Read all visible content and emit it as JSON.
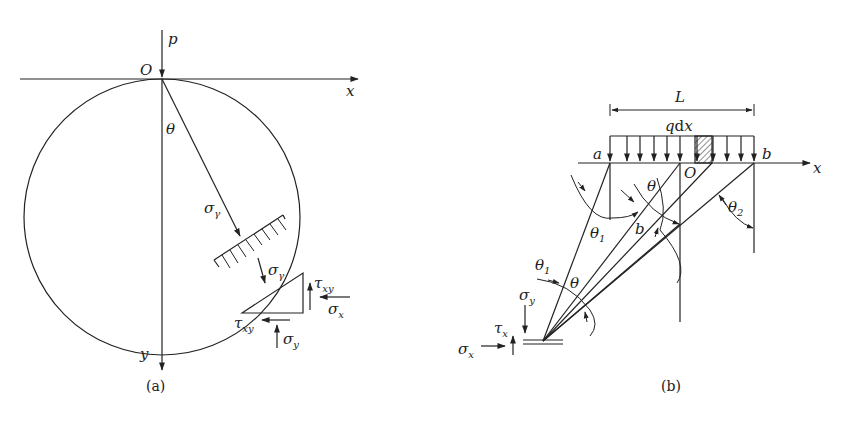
{
  "figure_a": {
    "caption": "(a)",
    "origin_label": "O",
    "load_label": "p",
    "x_axis_label": "x",
    "y_axis_label": "y",
    "angle_label": "θ",
    "radial_stress": {
      "base": "σ",
      "sub": "γ"
    },
    "element_stresses": {
      "sigma_r": {
        "base": "σ",
        "sub": "γ"
      },
      "tau_xy_right": {
        "base": "τ",
        "sub": "xy"
      },
      "sigma_x": {
        "base": "σ",
        "sub": "x"
      },
      "tau_xy_bottom": {
        "base": "τ",
        "sub": "xy"
      },
      "sigma_y": {
        "base": "σ",
        "sub": "y"
      }
    }
  },
  "figure_b": {
    "caption": "(b)",
    "span_label": "L",
    "load_label": {
      "q": "q",
      "d": "d",
      "x": "x"
    },
    "point_a": "a",
    "point_b_top": "b",
    "origin_label": "O",
    "x_axis_label": "x",
    "angle_theta": "θ",
    "angle_theta1": {
      "base": "θ",
      "sub": "1"
    },
    "angle_theta2": {
      "base": "θ",
      "sub": "2"
    },
    "angle_db": "b",
    "angle_theta1_lower": {
      "base": "θ",
      "sub": "1"
    },
    "angle_theta_lower": "θ",
    "stress_sigma_y": {
      "base": "σ",
      "sub": "y"
    },
    "stress_tau_x": {
      "base": "τ",
      "sub": "x"
    },
    "stress_sigma_x": {
      "base": "σ",
      "sub": "x"
    }
  }
}
